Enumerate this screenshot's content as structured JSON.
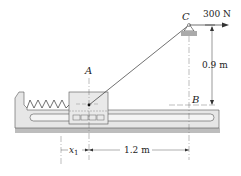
{
  "diagram": {
    "force_label": "300 N",
    "point_c_label": "C",
    "point_a_label": "A",
    "point_b_label": "B",
    "height_label": "0.9 m",
    "distance_label": "1.2 m",
    "x1_label": "x",
    "x1_subscript": "1",
    "colors": {
      "base_fill": "#e6e6e6",
      "base_shadow": "#bdbdbd",
      "line": "#333333",
      "slot_fill": "#f4f4f4",
      "pulley_hatch": "#999999"
    }
  }
}
